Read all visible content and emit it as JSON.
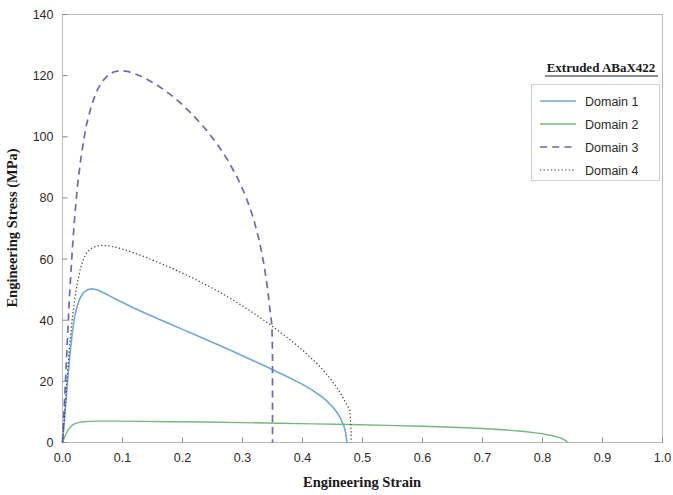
{
  "chart_data": {
    "type": "line",
    "title": "",
    "xlabel": "Engineering Strain",
    "ylabel": "Engineering Stress (MPa)",
    "xlim": [
      0.0,
      1.0
    ],
    "ylim": [
      0,
      140
    ],
    "xticks": [
      "0.0",
      "0.1",
      "0.2",
      "0.3",
      "0.4",
      "0.5",
      "0.6",
      "0.7",
      "0.8",
      "0.9",
      "1.0"
    ],
    "xtick_values": [
      0.0,
      0.1,
      0.2,
      0.3,
      0.4,
      0.5,
      0.6,
      0.7,
      0.8,
      0.9,
      1.0
    ],
    "yticks": [
      "0",
      "20",
      "40",
      "60",
      "80",
      "100",
      "120",
      "140"
    ],
    "ytick_values": [
      0,
      20,
      40,
      60,
      80,
      100,
      120,
      140
    ],
    "grid": false,
    "legend_position": "top-right",
    "legend_title": "Extruded ABaX422",
    "series": [
      {
        "name": "Domain 1",
        "color": "#6fa8dc",
        "style": "solid",
        "width": 1.6,
        "points": [
          [
            0.0,
            0.0
          ],
          [
            0.004,
            9.0
          ],
          [
            0.008,
            19.0
          ],
          [
            0.012,
            28.0
          ],
          [
            0.016,
            35.5
          ],
          [
            0.02,
            41.0
          ],
          [
            0.025,
            45.0
          ],
          [
            0.03,
            47.5
          ],
          [
            0.035,
            49.0
          ],
          [
            0.042,
            50.0
          ],
          [
            0.05,
            50.3
          ],
          [
            0.06,
            49.8
          ],
          [
            0.07,
            48.8
          ],
          [
            0.08,
            47.8
          ],
          [
            0.09,
            46.8
          ],
          [
            0.1,
            45.8
          ],
          [
            0.12,
            43.9
          ],
          [
            0.14,
            42.1
          ],
          [
            0.16,
            40.4
          ],
          [
            0.18,
            38.7
          ],
          [
            0.2,
            37.0
          ],
          [
            0.22,
            35.3
          ],
          [
            0.24,
            33.6
          ],
          [
            0.26,
            31.9
          ],
          [
            0.28,
            30.2
          ],
          [
            0.3,
            28.4
          ],
          [
            0.32,
            26.6
          ],
          [
            0.34,
            24.8
          ],
          [
            0.36,
            22.9
          ],
          [
            0.38,
            21.0
          ],
          [
            0.4,
            19.0
          ],
          [
            0.415,
            17.3
          ],
          [
            0.43,
            15.3
          ],
          [
            0.44,
            13.7
          ],
          [
            0.45,
            11.7
          ],
          [
            0.458,
            9.7
          ],
          [
            0.464,
            7.7
          ],
          [
            0.469,
            5.4
          ],
          [
            0.472,
            3.2
          ],
          [
            0.474,
            0.0
          ]
        ]
      },
      {
        "name": "Domain 2",
        "color": "#76b87c",
        "style": "solid",
        "width": 1.4,
        "points": [
          [
            0.0,
            0.0
          ],
          [
            0.004,
            2.0
          ],
          [
            0.008,
            3.6
          ],
          [
            0.012,
            4.8
          ],
          [
            0.016,
            5.6
          ],
          [
            0.02,
            6.1
          ],
          [
            0.026,
            6.5
          ],
          [
            0.034,
            6.8
          ],
          [
            0.045,
            6.9
          ],
          [
            0.06,
            7.0
          ],
          [
            0.09,
            7.0
          ],
          [
            0.13,
            6.9
          ],
          [
            0.18,
            6.8
          ],
          [
            0.24,
            6.7
          ],
          [
            0.3,
            6.5
          ],
          [
            0.36,
            6.3
          ],
          [
            0.42,
            6.1
          ],
          [
            0.48,
            5.9
          ],
          [
            0.54,
            5.6
          ],
          [
            0.6,
            5.3
          ],
          [
            0.65,
            5.0
          ],
          [
            0.7,
            4.6
          ],
          [
            0.74,
            4.1
          ],
          [
            0.77,
            3.6
          ],
          [
            0.795,
            3.0
          ],
          [
            0.815,
            2.3
          ],
          [
            0.83,
            1.5
          ],
          [
            0.838,
            0.7
          ],
          [
            0.842,
            0.0
          ]
        ]
      },
      {
        "name": "Domain 3",
        "color": "#6a6ab5",
        "style": "dashed",
        "width": 1.7,
        "points": [
          [
            0.0,
            0.0
          ],
          [
            0.004,
            16.0
          ],
          [
            0.008,
            33.0
          ],
          [
            0.012,
            49.0
          ],
          [
            0.016,
            62.0
          ],
          [
            0.02,
            73.0
          ],
          [
            0.025,
            84.0
          ],
          [
            0.03,
            92.0
          ],
          [
            0.035,
            98.5
          ],
          [
            0.04,
            104.0
          ],
          [
            0.048,
            110.0
          ],
          [
            0.056,
            114.5
          ],
          [
            0.065,
            117.8
          ],
          [
            0.075,
            120.0
          ],
          [
            0.085,
            121.2
          ],
          [
            0.097,
            121.7
          ],
          [
            0.11,
            121.3
          ],
          [
            0.125,
            120.3
          ],
          [
            0.14,
            118.9
          ],
          [
            0.16,
            116.6
          ],
          [
            0.18,
            113.8
          ],
          [
            0.2,
            110.5
          ],
          [
            0.22,
            106.6
          ],
          [
            0.24,
            102.2
          ],
          [
            0.26,
            97.0
          ],
          [
            0.275,
            92.5
          ],
          [
            0.29,
            87.2
          ],
          [
            0.305,
            80.8
          ],
          [
            0.318,
            73.5
          ],
          [
            0.328,
            66.0
          ],
          [
            0.336,
            58.0
          ],
          [
            0.342,
            50.0
          ],
          [
            0.346,
            43.0
          ],
          [
            0.349,
            38.5
          ],
          [
            0.35,
            30.0
          ],
          [
            0.35,
            18.0
          ],
          [
            0.35,
            6.0
          ],
          [
            0.35,
            0.0
          ]
        ]
      },
      {
        "name": "Domain 4",
        "color": "#3d3d3d",
        "style": "dotted",
        "width": 1.2,
        "points": [
          [
            0.0,
            0.0
          ],
          [
            0.004,
            11.0
          ],
          [
            0.008,
            22.0
          ],
          [
            0.012,
            32.0
          ],
          [
            0.016,
            40.0
          ],
          [
            0.02,
            46.5
          ],
          [
            0.025,
            52.5
          ],
          [
            0.03,
            57.0
          ],
          [
            0.035,
            60.0
          ],
          [
            0.04,
            62.0
          ],
          [
            0.048,
            63.5
          ],
          [
            0.056,
            64.2
          ],
          [
            0.066,
            64.5
          ],
          [
            0.078,
            64.3
          ],
          [
            0.09,
            63.8
          ],
          [
            0.105,
            63.0
          ],
          [
            0.12,
            62.0
          ],
          [
            0.14,
            60.5
          ],
          [
            0.16,
            58.9
          ],
          [
            0.18,
            57.2
          ],
          [
            0.2,
            55.4
          ],
          [
            0.22,
            53.5
          ],
          [
            0.24,
            51.5
          ],
          [
            0.26,
            49.4
          ],
          [
            0.28,
            47.1
          ],
          [
            0.3,
            44.7
          ],
          [
            0.32,
            42.1
          ],
          [
            0.34,
            39.4
          ],
          [
            0.36,
            36.5
          ],
          [
            0.38,
            33.5
          ],
          [
            0.4,
            30.2
          ],
          [
            0.42,
            26.6
          ],
          [
            0.435,
            23.6
          ],
          [
            0.448,
            20.5
          ],
          [
            0.458,
            17.8
          ],
          [
            0.466,
            15.2
          ],
          [
            0.472,
            13.0
          ],
          [
            0.476,
            11.6
          ],
          [
            0.479,
            10.5
          ],
          [
            0.48,
            7.0
          ],
          [
            0.481,
            3.5
          ],
          [
            0.481,
            0.0
          ]
        ]
      }
    ]
  },
  "legend": {
    "title": "Extruded ABaX422",
    "entries": [
      {
        "label": "Domain 1"
      },
      {
        "label": "Domain 2"
      },
      {
        "label": "Domain 3"
      },
      {
        "label": "Domain 4"
      }
    ]
  },
  "axes": {
    "x_label": "Engineering Strain",
    "y_label": "Engineering Stress (MPa)"
  }
}
